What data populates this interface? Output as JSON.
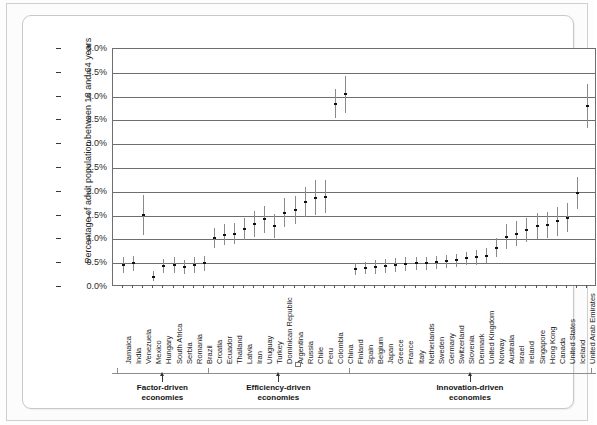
{
  "chart_data": {
    "type": "scatter",
    "title": "",
    "xlabel": "",
    "ylabel": "Percentage of adult population between 18 and 64 years",
    "ylim": [
      0.0,
      5.0
    ],
    "ytick_labels": [
      "0.0%",
      "0.5%",
      "1.0%",
      "1.5%",
      "2.0%",
      "2.5%",
      "3.0%",
      "3.5%",
      "4.0%",
      "4.5%",
      "5.0%"
    ],
    "ytick_values": [
      0.0,
      0.5,
      1.0,
      1.5,
      2.0,
      2.5,
      3.0,
      3.5,
      4.0,
      4.5,
      5.0
    ],
    "grid": true,
    "legend": "none",
    "error_bars": "vertical confidence intervals",
    "categories": [
      "Jamaica",
      "India",
      "Venezuela",
      "Mexico",
      "Hungary",
      "South Africa",
      "Serbia",
      "Romania",
      "Brazil",
      "Croatia",
      "Ecuador",
      "Thailand",
      "Latvia",
      "Iran",
      "Uruguay",
      "Turkey",
      "Dominican Republic",
      "Argentina",
      "Russia",
      "Chile",
      "Peru",
      "Colombia",
      "China",
      "Finland",
      "Spain",
      "Belgium",
      "Japan",
      "Greece",
      "France",
      "Italy",
      "Netherlands",
      "Sweden",
      "Germany",
      "Switzerland",
      "Slovenia",
      "Denmark",
      "United Kingdom",
      "Norway",
      "Australia",
      "Israel",
      "Ireland",
      "Singapore",
      "Hong Kong",
      "Canada",
      "United States",
      "Iceland",
      "United Arab Emirates"
    ],
    "values": [
      0.46,
      0.5,
      1.52,
      0.22,
      0.44,
      0.46,
      0.42,
      0.46,
      0.5,
      1.03,
      1.1,
      1.12,
      1.22,
      1.33,
      1.42,
      1.28,
      1.56,
      1.62,
      1.78,
      1.88,
      1.9,
      3.85,
      4.05,
      0.38,
      0.4,
      0.42,
      0.44,
      0.46,
      0.48,
      0.5,
      0.5,
      0.52,
      0.54,
      0.56,
      0.6,
      0.62,
      0.66,
      0.82,
      1.06,
      1.12,
      1.2,
      1.28,
      1.3,
      1.38,
      1.46,
      1.98,
      3.8
    ],
    "ci_low": [
      0.3,
      0.34,
      1.1,
      0.12,
      0.3,
      0.3,
      0.28,
      0.3,
      0.34,
      0.82,
      0.88,
      0.9,
      0.98,
      1.06,
      1.14,
      1.02,
      1.26,
      1.32,
      1.46,
      1.52,
      1.56,
      3.54,
      3.66,
      0.26,
      0.28,
      0.28,
      0.3,
      0.32,
      0.34,
      0.36,
      0.36,
      0.38,
      0.4,
      0.42,
      0.46,
      0.46,
      0.5,
      0.62,
      0.8,
      0.86,
      0.94,
      1.0,
      1.02,
      1.08,
      1.16,
      1.64,
      3.34
    ],
    "ci_high": [
      0.62,
      0.66,
      1.94,
      0.34,
      0.58,
      0.62,
      0.56,
      0.62,
      0.66,
      1.24,
      1.32,
      1.34,
      1.46,
      1.6,
      1.7,
      1.54,
      1.86,
      1.92,
      2.1,
      2.24,
      2.24,
      4.16,
      4.44,
      0.5,
      0.52,
      0.56,
      0.58,
      0.6,
      0.62,
      0.64,
      0.64,
      0.66,
      0.68,
      0.7,
      0.74,
      0.78,
      0.82,
      1.02,
      1.32,
      1.38,
      1.46,
      1.56,
      1.58,
      1.68,
      1.76,
      2.32,
      4.26
    ],
    "groups": [
      {
        "label": "Factor-driven\neconomies",
        "start_index": 0,
        "end_index": 8
      },
      {
        "label": "Efficiency-driven\neconomies",
        "start_index": 9,
        "end_index": 22
      },
      {
        "label": "Innovation-driven\neconomies",
        "start_index": 23,
        "end_index": 46
      }
    ]
  },
  "colors": {
    "point": "#111111",
    "error_bar": "#8a8a8a",
    "gridline": "#6e6e6e",
    "axis_text": "#232323",
    "card_background": "#ffffff",
    "page_background": "#fcfcfc"
  }
}
